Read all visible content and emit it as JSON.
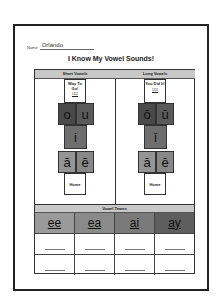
{
  "worksheet": {
    "name_label": "Name",
    "name_value": "Orlando",
    "title": "I Know My Vowel Sounds!",
    "short_vowels": {
      "header": "Short Vowels",
      "goal_text": "Way To Go!",
      "tally": "1111",
      "tiles": [
        "o",
        "u",
        "i",
        "ă",
        "ĕ"
      ],
      "home_label": "Home"
    },
    "long_vowels": {
      "header": "Long Vowels",
      "goal_text": "You Did It!",
      "tally": "1111",
      "tiles": [
        "ō",
        "ū",
        "ī",
        "ā",
        "ē"
      ],
      "home_label": "Home"
    },
    "vowel_teams": {
      "header": "Vowel Teams",
      "tiles": [
        {
          "label": "ee",
          "color": "#9a9a9a"
        },
        {
          "label": "ea",
          "color": "#8a8a8a"
        },
        {
          "label": "ai",
          "color": "#7a7a7a"
        },
        {
          "label": "ay",
          "color": "#5e5e5e"
        }
      ],
      "blank_rows": 2
    }
  }
}
